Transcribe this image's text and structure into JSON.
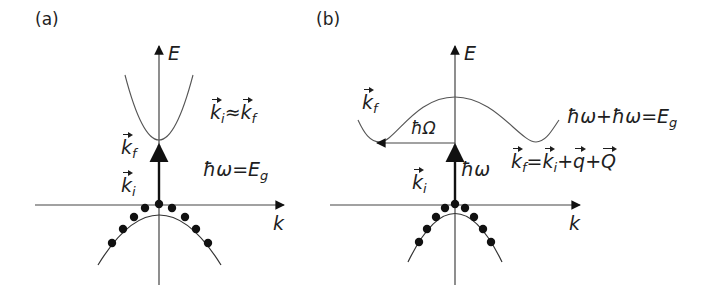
{
  "panels": [
    {
      "id": "a",
      "label": "(a)",
      "axes": {
        "y_label": "E",
        "x_label": "k"
      },
      "annotations": {
        "kf_label": "k",
        "kf_sub": "f",
        "ki_label": "k",
        "ki_sub": "i",
        "momentum_relation": {
          "lhs": "k",
          "lhs_sub": "i",
          "op": "≈",
          "rhs": "k",
          "rhs_sub": "f"
        },
        "energy_relation": {
          "lhs": "ħω",
          "op": "=",
          "rhs": "E",
          "rhs_sub": "g"
        }
      },
      "transition": "direct",
      "valence_dots": 9
    },
    {
      "id": "b",
      "label": "(b)",
      "axes": {
        "y_label": "E",
        "x_label": "k"
      },
      "annotations": {
        "kf_label": "k",
        "kf_sub": "f",
        "ki_label": "k",
        "ki_sub": "i",
        "phonon_label": "ħΩ",
        "photon_label": "ħω",
        "energy_relation": {
          "text": "ħω+ħω=",
          "rhs": "E",
          "rhs_sub": "g"
        },
        "momentum_relation": {
          "k1": "k",
          "k1_sub": "f",
          "eq": "=",
          "k2": "k",
          "k2_sub": "i",
          "plus1": "+",
          "q": "q",
          "plus2": "+",
          "Q": "Q"
        }
      },
      "transition": "indirect",
      "valence_dots": 9
    }
  ]
}
